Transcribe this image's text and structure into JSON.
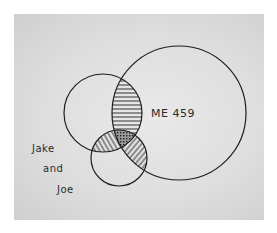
{
  "diagram": {
    "type": "venn",
    "sets": [
      {
        "id": "me459",
        "label": "ME 459",
        "cx": 179,
        "cy": 113,
        "r": 67
      },
      {
        "id": "left",
        "label": "",
        "cx": 103,
        "cy": 113,
        "r": 39
      },
      {
        "id": "bottom",
        "label": "",
        "cx": 119,
        "cy": 158,
        "r": 28
      }
    ],
    "labels": {
      "me459": "ME 459",
      "jake_and_joe": [
        "Jake",
        "and",
        "Joe"
      ]
    },
    "shading": {
      "left_me459": "horizontal-hatch",
      "left_bottom": "diagonal-hatch",
      "me459_bottom": "diagonal-hatch",
      "all_three": "cross-hatch"
    },
    "colors": {
      "background": "#ffffff",
      "paper": "#dedede",
      "ink": "#1e1e1e"
    }
  }
}
